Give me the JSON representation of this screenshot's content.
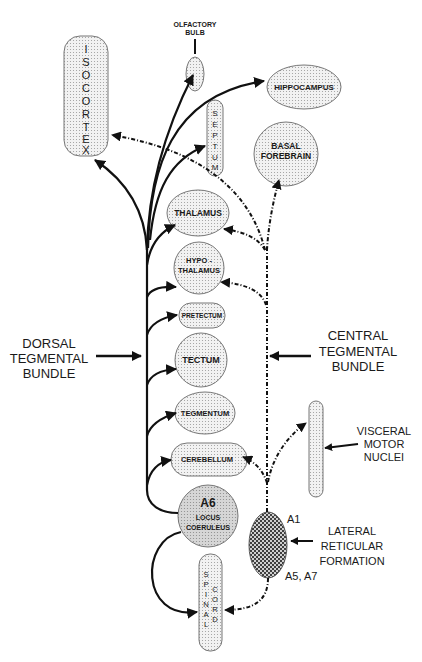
{
  "diagram": {
    "type": "neuroanatomy-pathway",
    "nodes": {
      "isocortex": {
        "label": "ISOCORTEX",
        "letters": [
          "I",
          "S",
          "O",
          "C",
          "O",
          "R",
          "T",
          "E",
          "X"
        ]
      },
      "olfactory_bulb": {
        "label": "OLFACTORY BULB",
        "line1": "OLFACTORY",
        "line2": "BULB"
      },
      "hippocampus": {
        "label": "HIPPOCAMPUS"
      },
      "septum": {
        "label": "SEPTUM",
        "letters": [
          "S",
          "E",
          "P",
          "T",
          "U",
          "M"
        ]
      },
      "basal_forebrain": {
        "label": "BASAL FOREBRAIN",
        "line1": "BASAL",
        "line2": "FOREBRAIN"
      },
      "thalamus": {
        "label": "THALAMUS"
      },
      "hypothalamus": {
        "label": "HYPO-THALAMUS",
        "line1": "HYPO -",
        "line2": "THALAMUS"
      },
      "pretectum": {
        "label": "PRETECTUM"
      },
      "tectum": {
        "label": "TECTUM"
      },
      "tegmentum": {
        "label": "TEGMENTUM"
      },
      "cerebellum": {
        "label": "CEREBELLUM"
      },
      "locus_coeruleus": {
        "label": "A6 LOCUS COERULEUS",
        "line0": "A6",
        "line1": "LOCUS",
        "line2": "COERULEUS"
      },
      "spinal_cord": {
        "label": "SPINAL CORD",
        "col1": [
          "S",
          "P",
          "I",
          "N",
          "A",
          "L"
        ],
        "col2": [
          "C",
          "O",
          "R",
          "D"
        ]
      },
      "visceral_motor_nuclei": {
        "label": "VISCERAL MOTOR NUCLEI",
        "line1": "VISCERAL",
        "line2": "MOTOR",
        "line3": "NUCLEI"
      },
      "lateral_reticular_formation": {
        "label": "LATERAL RETICULAR FORMATION",
        "line1": "LATERAL",
        "line2": "RETICULAR",
        "line3": "FORMATION",
        "top_tag": "A1",
        "bottom_tag": "A5, A7"
      }
    },
    "bundles": {
      "dorsal": {
        "line1": "DORSAL",
        "line2": "TEGMENTAL",
        "line3": "BUNDLE"
      },
      "central": {
        "line1": "CENTRAL",
        "line2": "TEGMENTAL",
        "line3": "BUNDLE"
      }
    },
    "edges": [
      {
        "from": "locus_coeruleus",
        "to": "isocortex",
        "style": "solid"
      },
      {
        "from": "locus_coeruleus",
        "to": "olfactory_bulb",
        "style": "solid"
      },
      {
        "from": "locus_coeruleus",
        "to": "hippocampus",
        "style": "solid"
      },
      {
        "from": "locus_coeruleus",
        "to": "septum",
        "style": "solid"
      },
      {
        "from": "locus_coeruleus",
        "to": "thalamus",
        "style": "solid"
      },
      {
        "from": "locus_coeruleus",
        "to": "hypothalamus",
        "style": "solid"
      },
      {
        "from": "locus_coeruleus",
        "to": "pretectum",
        "style": "solid"
      },
      {
        "from": "locus_coeruleus",
        "to": "tectum",
        "style": "solid"
      },
      {
        "from": "locus_coeruleus",
        "to": "tegmentum",
        "style": "solid"
      },
      {
        "from": "locus_coeruleus",
        "to": "cerebellum",
        "style": "solid"
      },
      {
        "from": "locus_coeruleus",
        "to": "spinal_cord",
        "style": "solid"
      },
      {
        "from": "lateral_reticular_formation",
        "to": "isocortex",
        "style": "dashed"
      },
      {
        "from": "lateral_reticular_formation",
        "to": "basal_forebrain",
        "style": "dashed"
      },
      {
        "from": "lateral_reticular_formation",
        "to": "thalamus",
        "style": "dashed"
      },
      {
        "from": "lateral_reticular_formation",
        "to": "hypothalamus",
        "style": "dashed"
      },
      {
        "from": "lateral_reticular_formation",
        "to": "cerebellum",
        "style": "dashed"
      },
      {
        "from": "lateral_reticular_formation",
        "to": "visceral_motor_nuclei",
        "style": "dashed"
      },
      {
        "from": "lateral_reticular_formation",
        "to": "spinal_cord",
        "style": "dashed"
      }
    ]
  }
}
